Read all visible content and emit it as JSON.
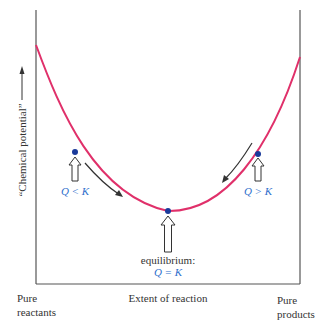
{
  "diagram": {
    "y_axis_label": "“Chemical potential”",
    "x_axis_label": "Extent of reaction",
    "x_left_label_line1": "Pure",
    "x_left_label_line2": "reactants",
    "x_right_label_line1": "Pure",
    "x_right_label_line2": "products",
    "left_point_label": "Q < K",
    "right_point_label": "Q > K",
    "equilibrium_label": "equilibrium:",
    "equilibrium_condition": "Q = K",
    "colors": {
      "curve": "#e0306a",
      "points": "#1a3a9a",
      "condition_text": "#2f6fcc",
      "axes": "#555555"
    }
  }
}
